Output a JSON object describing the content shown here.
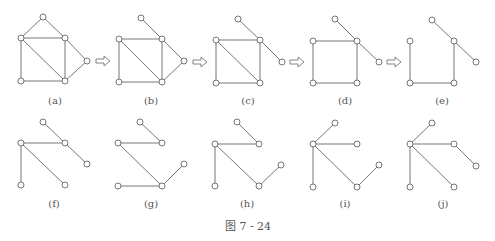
{
  "figure": {
    "caption": "图 7 - 24",
    "caption_pos": [
      248,
      226
    ],
    "node_radius": 3,
    "colors": {
      "edge": "#777777",
      "node_stroke": "#666666",
      "text": "#555555"
    },
    "node_order": [
      "top",
      "lt",
      "rt",
      "fr",
      "bl",
      "br"
    ],
    "panels": [
      {
        "label": "(a)",
        "label_pos": [
          55,
          100
        ],
        "nodes": [
          [
            43,
            17
          ],
          [
            21,
            38
          ],
          [
            65,
            38
          ],
          [
            87,
            61
          ],
          [
            21,
            81
          ],
          [
            65,
            81
          ]
        ],
        "edges": [
          [
            "top",
            "lt"
          ],
          [
            "top",
            "rt"
          ],
          [
            "lt",
            "rt"
          ],
          [
            "lt",
            "bl"
          ],
          [
            "lt",
            "br"
          ],
          [
            "rt",
            "br"
          ],
          [
            "rt",
            "fr"
          ],
          [
            "fr",
            "br"
          ],
          [
            "bl",
            "br"
          ]
        ]
      },
      {
        "label": "(b)",
        "label_pos": [
          151,
          100
        ],
        "nodes": [
          [
            141,
            18
          ],
          [
            119,
            39
          ],
          [
            162,
            39
          ],
          [
            184,
            61
          ],
          [
            119,
            82
          ],
          [
            162,
            82
          ]
        ],
        "edges": [
          [
            "top",
            "rt"
          ],
          [
            "lt",
            "rt"
          ],
          [
            "lt",
            "bl"
          ],
          [
            "lt",
            "br"
          ],
          [
            "rt",
            "br"
          ],
          [
            "rt",
            "fr"
          ],
          [
            "fr",
            "br"
          ],
          [
            "bl",
            "br"
          ]
        ]
      },
      {
        "label": "(c)",
        "label_pos": [
          248,
          100
        ],
        "nodes": [
          [
            238,
            19
          ],
          [
            216,
            40
          ],
          [
            260,
            40
          ],
          [
            282,
            62
          ],
          [
            216,
            83
          ],
          [
            260,
            83
          ]
        ],
        "edges": [
          [
            "top",
            "rt"
          ],
          [
            "lt",
            "rt"
          ],
          [
            "lt",
            "bl"
          ],
          [
            "lt",
            "br"
          ],
          [
            "rt",
            "br"
          ],
          [
            "rt",
            "fr"
          ],
          [
            "bl",
            "br"
          ]
        ]
      },
      {
        "label": "(d)",
        "label_pos": [
          345,
          100
        ],
        "nodes": [
          [
            335,
            19
          ],
          [
            313,
            41
          ],
          [
            357,
            41
          ],
          [
            379,
            62
          ],
          [
            313,
            83
          ],
          [
            357,
            83
          ]
        ],
        "edges": [
          [
            "top",
            "rt"
          ],
          [
            "lt",
            "rt"
          ],
          [
            "lt",
            "bl"
          ],
          [
            "rt",
            "br"
          ],
          [
            "rt",
            "fr"
          ],
          [
            "bl",
            "br"
          ]
        ]
      },
      {
        "label": "(e)",
        "label_pos": [
          442,
          100
        ],
        "nodes": [
          [
            432,
            20
          ],
          [
            410,
            41
          ],
          [
            454,
            41
          ],
          [
            476,
            62
          ],
          [
            410,
            83
          ],
          [
            454,
            83
          ]
        ],
        "edges": [
          [
            "top",
            "rt"
          ],
          [
            "lt",
            "bl"
          ],
          [
            "rt",
            "br"
          ],
          [
            "rt",
            "fr"
          ],
          [
            "bl",
            "br"
          ]
        ]
      },
      {
        "label": "(f)",
        "label_pos": [
          54,
          203
        ],
        "nodes": [
          [
            43,
            122
          ],
          [
            21,
            143
          ],
          [
            65,
            143
          ],
          [
            87,
            164
          ],
          [
            21,
            185
          ],
          [
            65,
            185
          ]
        ],
        "edges": [
          [
            "top",
            "rt"
          ],
          [
            "lt",
            "rt"
          ],
          [
            "lt",
            "bl"
          ],
          [
            "lt",
            "br"
          ],
          [
            "rt",
            "fr"
          ]
        ]
      },
      {
        "label": "(g)",
        "label_pos": [
          151,
          203
        ],
        "nodes": [
          [
            140,
            122
          ],
          [
            118,
            143
          ],
          [
            162,
            143
          ],
          [
            184,
            164
          ],
          [
            118,
            186
          ],
          [
            162,
            186
          ]
        ],
        "edges": [
          [
            "top",
            "rt"
          ],
          [
            "lt",
            "rt"
          ],
          [
            "lt",
            "br"
          ],
          [
            "bl",
            "br"
          ],
          [
            "br",
            "fr"
          ]
        ]
      },
      {
        "label": "(h)",
        "label_pos": [
          247,
          203
        ],
        "nodes": [
          [
            237,
            122
          ],
          [
            215,
            144
          ],
          [
            259,
            144
          ],
          [
            281,
            165
          ],
          [
            215,
            186
          ],
          [
            259,
            186
          ]
        ],
        "edges": [
          [
            "top",
            "rt"
          ],
          [
            "lt",
            "rt"
          ],
          [
            "lt",
            "bl"
          ],
          [
            "lt",
            "br"
          ],
          [
            "br",
            "fr"
          ]
        ]
      },
      {
        "label": "(i)",
        "label_pos": [
          345,
          203
        ],
        "nodes": [
          [
            335,
            123
          ],
          [
            313,
            144
          ],
          [
            357,
            144
          ],
          [
            379,
            165
          ],
          [
            313,
            187
          ],
          [
            357,
            187
          ]
        ],
        "edges": [
          [
            "top",
            "lt"
          ],
          [
            "lt",
            "rt"
          ],
          [
            "lt",
            "bl"
          ],
          [
            "lt",
            "br"
          ],
          [
            "br",
            "fr"
          ]
        ]
      },
      {
        "label": "(j)",
        "label_pos": [
          443,
          203
        ],
        "nodes": [
          [
            432,
            123
          ],
          [
            410,
            144
          ],
          [
            454,
            144
          ],
          [
            476,
            166
          ],
          [
            410,
            187
          ],
          [
            454,
            187
          ]
        ],
        "edges": [
          [
            "top",
            "lt"
          ],
          [
            "lt",
            "rt"
          ],
          [
            "lt",
            "bl"
          ],
          [
            "lt",
            "br"
          ],
          [
            "rt",
            "fr"
          ]
        ]
      }
    ],
    "arrows": [
      {
        "symbol": "⇨",
        "pos": [
          103,
          61
        ]
      },
      {
        "symbol": "⇨",
        "pos": [
          200,
          62
        ]
      },
      {
        "symbol": "⇨",
        "pos": [
          297,
          62
        ]
      },
      {
        "symbol": "⇨",
        "pos": [
          394,
          62
        ]
      }
    ]
  }
}
